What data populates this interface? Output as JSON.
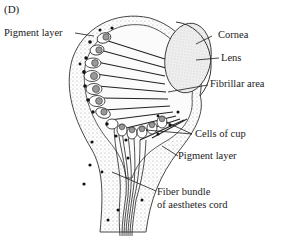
{
  "figure": {
    "panel_label": "(D)",
    "labels": {
      "pigment_layer_top": "Pigment layer",
      "cornea": "Cornea",
      "lens": "Lens",
      "fibrillar_area": "Fibrillar area",
      "cells_of_cup": "Cells of cup",
      "pigment_layer_bottom": "Pigment layer",
      "fiber_bundle_line1": "Fiber bundle",
      "fiber_bundle_line2": "of aesthetes cord"
    },
    "colors": {
      "ink": "#1a1a1a",
      "stipple": "#9a9a9a",
      "lens_fill": "#e6e6e6",
      "background": "#ffffff"
    }
  }
}
